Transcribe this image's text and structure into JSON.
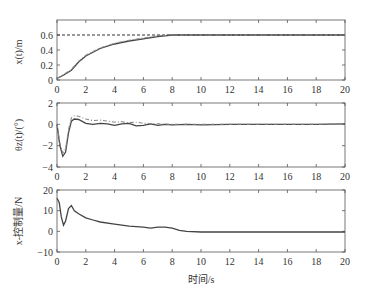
{
  "chart_data": [
    {
      "type": "line",
      "title": "",
      "ylabel": "x(t)/m",
      "xlabel": "",
      "xlim": [
        0,
        20
      ],
      "ylim": [
        0,
        0.8
      ],
      "xticks": [
        0,
        2,
        4,
        6,
        8,
        10,
        12,
        14,
        16,
        18,
        20
      ],
      "yticks": [
        0,
        0.2,
        0.4,
        0.6
      ],
      "ytick_labels": [
        "0",
        "0.2",
        "0.4",
        "0.6"
      ],
      "series": [
        {
          "name": "reference",
          "style": "dashed",
          "x": [
            0,
            20
          ],
          "y": [
            0.6,
            0.6
          ]
        },
        {
          "name": "response",
          "style": "solid",
          "x": [
            0,
            0.5,
            1,
            1.5,
            2,
            3,
            4,
            5,
            6,
            7,
            8,
            9,
            10,
            12,
            14,
            16,
            18,
            20
          ],
          "y": [
            0.02,
            0.07,
            0.13,
            0.24,
            0.32,
            0.42,
            0.48,
            0.52,
            0.55,
            0.58,
            0.6,
            0.6,
            0.6,
            0.6,
            0.6,
            0.6,
            0.6,
            0.6
          ]
        },
        {
          "name": "response-2",
          "style": "dashdot",
          "x": [
            0,
            0.5,
            1,
            1.5,
            2,
            3,
            4,
            5,
            6,
            7,
            8,
            9,
            10,
            12,
            14,
            16,
            18,
            20
          ],
          "y": [
            0.02,
            0.08,
            0.14,
            0.25,
            0.33,
            0.43,
            0.49,
            0.53,
            0.56,
            0.585,
            0.6,
            0.6,
            0.6,
            0.6,
            0.6,
            0.6,
            0.6,
            0.6
          ]
        }
      ]
    },
    {
      "type": "line",
      "title": "",
      "ylabel": "θz(t)/(°)",
      "xlabel": "",
      "xlim": [
        0,
        20
      ],
      "ylim": [
        -4,
        2
      ],
      "xticks": [
        0,
        2,
        4,
        6,
        8,
        10,
        12,
        14,
        16,
        18,
        20
      ],
      "yticks": [
        -4,
        -2,
        0,
        2
      ],
      "ytick_labels": [
        "−4",
        "−2",
        "0",
        "2"
      ],
      "series": [
        {
          "name": "response",
          "style": "solid",
          "x": [
            0,
            0.2,
            0.4,
            0.6,
            0.8,
            1.0,
            1.2,
            1.5,
            2,
            2.5,
            3,
            3.5,
            4,
            4.5,
            5,
            5.5,
            6,
            6.5,
            7,
            7.5,
            8,
            9,
            10,
            12,
            14,
            16,
            18,
            20
          ],
          "y": [
            0,
            -2.0,
            -3.0,
            -2.6,
            -0.8,
            0.3,
            0.5,
            0.45,
            0.1,
            0.0,
            0.1,
            0.05,
            -0.1,
            0.05,
            0.1,
            -0.15,
            -0.1,
            0.05,
            -0.1,
            0.0,
            -0.05,
            0.0,
            -0.05,
            0.0,
            0.0,
            0.0,
            0.0,
            0.05
          ]
        },
        {
          "name": "response-2",
          "style": "dashdot",
          "x": [
            0,
            0.2,
            0.4,
            0.6,
            0.8,
            1.0,
            1.2,
            1.5,
            2,
            2.5,
            3,
            3.5,
            4,
            4.5,
            5,
            5.5,
            6,
            7,
            8,
            9,
            10,
            12,
            14,
            16,
            18,
            20
          ],
          "y": [
            0,
            -1.8,
            -2.7,
            -2.3,
            -0.5,
            0.6,
            0.8,
            0.75,
            0.5,
            0.35,
            0.4,
            0.3,
            0.2,
            0.25,
            0.15,
            0.2,
            0.1,
            0.05,
            0.0,
            0.0,
            0.0,
            0.0,
            0.0,
            0.0,
            0.0,
            0.05
          ]
        }
      ]
    },
    {
      "type": "line",
      "title": "",
      "ylabel": "x-控制量/N",
      "xlabel": "时间/s",
      "xlim": [
        0,
        20
      ],
      "ylim": [
        -10,
        20
      ],
      "xticks": [
        0,
        2,
        4,
        6,
        8,
        10,
        12,
        14,
        16,
        18,
        20
      ],
      "yticks": [
        -10,
        0,
        10,
        20
      ],
      "ytick_labels": [
        "−10",
        "0",
        "10",
        "20"
      ],
      "series": [
        {
          "name": "control",
          "style": "solid",
          "x": [
            0,
            0.15,
            0.3,
            0.45,
            0.6,
            0.8,
            1.0,
            1.2,
            1.5,
            2,
            2.5,
            3,
            4,
            5,
            6,
            6.5,
            7,
            7.5,
            8,
            8.5,
            9,
            10,
            12,
            14,
            16,
            18,
            20
          ],
          "y": [
            16,
            14,
            7,
            3,
            5,
            11,
            12.5,
            10,
            8.5,
            6.5,
            5.5,
            4.5,
            3.5,
            2.5,
            2,
            1.5,
            2,
            2,
            1.5,
            0.5,
            0,
            -0.3,
            -0.3,
            -0.3,
            -0.3,
            -0.3,
            -0.3
          ]
        }
      ]
    }
  ]
}
